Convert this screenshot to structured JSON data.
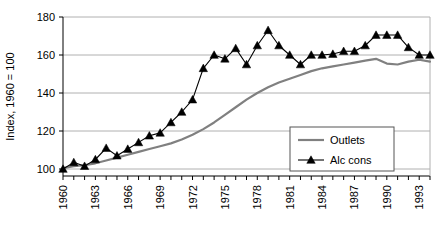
{
  "chart_data": {
    "type": "line",
    "title": "",
    "xlabel": "",
    "ylabel": "Index, 1960 = 100",
    "xlim": [
      1960,
      1994
    ],
    "ylim": [
      95,
      180
    ],
    "yticks": [
      100,
      120,
      140,
      160,
      180
    ],
    "xticks": [
      1960,
      1963,
      1966,
      1969,
      1972,
      1975,
      1978,
      1981,
      1984,
      1987,
      1990,
      1993
    ],
    "xtick_labels": [
      "1960",
      "1963",
      "1966",
      "1969",
      "1972",
      "1975",
      "1978",
      "1981",
      "1984",
      "1987",
      "1990",
      "1993"
    ],
    "ytick_labels": [
      "100",
      "120",
      "140",
      "160",
      "180"
    ],
    "grid": "horizontal",
    "legend_position": "inside-right-lower",
    "x": [
      1960,
      1961,
      1962,
      1963,
      1964,
      1965,
      1966,
      1967,
      1968,
      1969,
      1970,
      1971,
      1972,
      1973,
      1974,
      1975,
      1976,
      1977,
      1978,
      1979,
      1980,
      1981,
      1982,
      1983,
      1984,
      1985,
      1986,
      1987,
      1988,
      1989,
      1990,
      1991,
      1992,
      1993,
      1994
    ],
    "series": [
      {
        "name": "Outlets",
        "marker": "none",
        "color": "#808080",
        "values": [
          100.5,
          101.5,
          102.0,
          103.0,
          104.5,
          106.0,
          107.5,
          109.0,
          110.5,
          112.0,
          113.5,
          115.5,
          118.0,
          121.0,
          124.5,
          128.5,
          132.5,
          136.5,
          140.0,
          143.0,
          145.5,
          147.5,
          149.5,
          151.5,
          153.0,
          154.0,
          155.0,
          156.0,
          157.0,
          158.0,
          155.5,
          155.0,
          156.5,
          157.5,
          156.5
        ]
      },
      {
        "name": "Alc cons",
        "marker": "triangle",
        "color": "#000000",
        "values": [
          100.0,
          103.5,
          101.5,
          105.0,
          111.0,
          107.0,
          110.5,
          114.0,
          117.5,
          119.0,
          124.5,
          130.0,
          136.5,
          153.0,
          160.0,
          158.0,
          163.5,
          155.0,
          165.0,
          173.0,
          165.0,
          160.0,
          155.0,
          160.0,
          160.0,
          160.5,
          162.0,
          162.0,
          165.0,
          170.5,
          170.5,
          170.5,
          164.0,
          160.0,
          160.0
        ]
      }
    ],
    "legend": [
      {
        "label": "Outlets",
        "color": "#808080",
        "marker": "none"
      },
      {
        "label": "Alc cons",
        "color": "#000000",
        "marker": "triangle"
      }
    ]
  }
}
